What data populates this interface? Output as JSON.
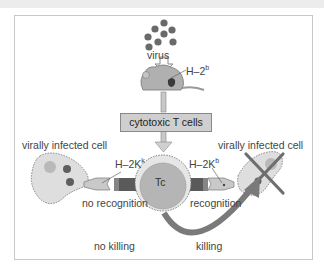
{
  "diagram": {
    "labels": {
      "virus": "virus",
      "mouse_mhc": "H–2",
      "mouse_mhc_sup": "b",
      "cytotoxic_t_cells": "cytotoxic T cells",
      "tc": "Tc",
      "left_cell": "virally infected cell",
      "right_cell": "virally infected cell",
      "left_mhc": "H–2K",
      "left_mhc_sup": "k",
      "right_mhc": "H–2K",
      "right_mhc_sup": "b",
      "no_recognition": "no recognition",
      "recognition": "recognition",
      "no_killing": "no killing",
      "killing": "killing"
    },
    "colors": {
      "fill_light": "#e4e4e4",
      "fill_mid": "#bdbdbd",
      "fill_dark": "#6e6e6e",
      "virus_dot": "#6a6a6a",
      "arrow": "#7a7a7a",
      "text": "#444444"
    }
  }
}
